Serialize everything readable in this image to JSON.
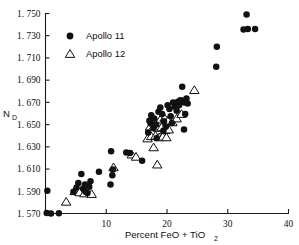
{
  "chart_data": {
    "type": "scatter",
    "title": "",
    "xlabel": "Percent FeO + TiO2",
    "xlabel_main": "Percent FeO + TiO",
    "xlabel_sub": "2",
    "ylabel": "ND",
    "ylabel_main": "N",
    "ylabel_sub": "D",
    "xlim": [
      0,
      40
    ],
    "ylim": [
      1.57,
      1.75
    ],
    "xticks": [
      0,
      10,
      20,
      30,
      40
    ],
    "xtick_labels": [
      "",
      "10",
      "20",
      "30",
      "40"
    ],
    "yticks": [
      1.57,
      1.59,
      1.61,
      1.63,
      1.65,
      1.67,
      1.69,
      1.71,
      1.73,
      1.75
    ],
    "ytick_labels": [
      "1. 570",
      "1. 590",
      "1. 610",
      "1. 630",
      "1. 650",
      "1. 670",
      "1. 690",
      "1. 710",
      "1. 730",
      "1. 750"
    ],
    "grid": false,
    "legend_position": "upper-left",
    "series": [
      {
        "name": "Apollo 11",
        "marker": "filled-circle",
        "color": "#111111",
        "points": [
          [
            0.3,
            1.5905
          ],
          [
            0.2,
            1.5705
          ],
          [
            0.9,
            1.57
          ],
          [
            2.2,
            1.5702
          ],
          [
            4.6,
            1.5895
          ],
          [
            5.1,
            1.5935
          ],
          [
            5.4,
            1.5975
          ],
          [
            5.9,
            1.6055
          ],
          [
            6.2,
            1.5925
          ],
          [
            6.5,
            1.596
          ],
          [
            6.6,
            1.5895
          ],
          [
            6.9,
            1.5885
          ],
          [
            7.2,
            1.594
          ],
          [
            7.4,
            1.599
          ],
          [
            8.8,
            1.6075
          ],
          [
            10.8,
            1.626
          ],
          [
            10.7,
            1.596
          ],
          [
            11.1,
            1.6095
          ],
          [
            11.0,
            1.6045
          ],
          [
            13.3,
            1.625
          ],
          [
            13.9,
            1.6245
          ],
          [
            15.9,
            1.6175
          ],
          [
            17.4,
            1.6585
          ],
          [
            17.8,
            1.647
          ],
          [
            17.3,
            1.651
          ],
          [
            17.1,
            1.6535
          ],
          [
            17.9,
            1.6555
          ],
          [
            18.2,
            1.65
          ],
          [
            18.6,
            1.6615
          ],
          [
            18.9,
            1.6655
          ],
          [
            19.2,
            1.6595
          ],
          [
            19.5,
            1.653
          ],
          [
            19.8,
            1.648
          ],
          [
            19.4,
            1.6445
          ],
          [
            20.1,
            1.6675
          ],
          [
            20.4,
            1.664
          ],
          [
            20.6,
            1.6575
          ],
          [
            20.8,
            1.6515
          ],
          [
            21.0,
            1.67
          ],
          [
            21.3,
            1.666
          ],
          [
            21.6,
            1.6625
          ],
          [
            21.8,
            1.6705
          ],
          [
            22.0,
            1.6675
          ],
          [
            22.2,
            1.672
          ],
          [
            22.5,
            1.684
          ],
          [
            22.6,
            1.6715
          ],
          [
            22.9,
            1.67
          ],
          [
            23.2,
            1.6735
          ],
          [
            23.4,
            1.669
          ],
          [
            23.0,
            1.6595
          ],
          [
            22.8,
            1.6455
          ],
          [
            16.9,
            1.643
          ],
          [
            18.3,
            1.638
          ],
          [
            28.2,
            1.72
          ],
          [
            28.1,
            1.702
          ],
          [
            32.6,
            1.7355
          ],
          [
            33.1,
            1.749
          ],
          [
            33.3,
            1.736
          ],
          [
            34.5,
            1.736
          ]
        ]
      },
      {
        "name": "Apollo 12",
        "marker": "open-triangle",
        "color": "#111111",
        "points": [
          [
            3.4,
            1.5805
          ],
          [
            4.8,
            1.59
          ],
          [
            5.6,
            1.589
          ],
          [
            6.4,
            1.588
          ],
          [
            7.6,
            1.5875
          ],
          [
            11.2,
            1.6115
          ],
          [
            14.2,
            1.623
          ],
          [
            14.9,
            1.621
          ],
          [
            17.8,
            1.6295
          ],
          [
            18.4,
            1.614
          ],
          [
            16.8,
            1.6375
          ],
          [
            17.4,
            1.6395
          ],
          [
            18.1,
            1.64
          ],
          [
            18.7,
            1.6385
          ],
          [
            19.3,
            1.639
          ],
          [
            19.9,
            1.6385
          ],
          [
            17.2,
            1.648
          ],
          [
            17.9,
            1.649
          ],
          [
            18.5,
            1.647
          ],
          [
            19.1,
            1.6475
          ],
          [
            19.7,
            1.645
          ],
          [
            20.3,
            1.6455
          ],
          [
            18.9,
            1.6545
          ],
          [
            19.6,
            1.656
          ],
          [
            20.2,
            1.6535
          ],
          [
            20.9,
            1.652
          ],
          [
            21.6,
            1.6555
          ],
          [
            22.4,
            1.6595
          ],
          [
            24.5,
            1.681
          ]
        ]
      }
    ]
  },
  "legend": {
    "items": [
      {
        "label": "Apollo 11",
        "marker": "filled-circle"
      },
      {
        "label": "Apollo 12",
        "marker": "open-triangle"
      }
    ]
  }
}
